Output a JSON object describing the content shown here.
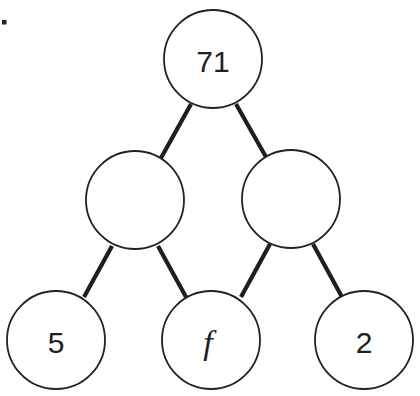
{
  "diagram": {
    "type": "number-bond-tree",
    "marker": ".",
    "nodes": [
      {
        "id": "top",
        "label": "71",
        "cx": 213,
        "cy": 59,
        "r": 49
      },
      {
        "id": "mid-left",
        "label": "",
        "cx": 135,
        "cy": 200,
        "r": 49
      },
      {
        "id": "mid-right",
        "label": "",
        "cx": 291,
        "cy": 199,
        "r": 49
      },
      {
        "id": "bottom-left",
        "label": "5",
        "cx": 56,
        "cy": 340,
        "r": 49
      },
      {
        "id": "bottom-middle",
        "label": "f",
        "cx": 211,
        "cy": 340,
        "r": 49,
        "italic": true
      },
      {
        "id": "bottom-right",
        "label": "2",
        "cx": 364,
        "cy": 340,
        "r": 49
      }
    ],
    "edges": [
      {
        "from": "top",
        "to": "mid-left"
      },
      {
        "from": "top",
        "to": "mid-right"
      },
      {
        "from": "mid-left",
        "to": "bottom-left"
      },
      {
        "from": "mid-left",
        "to": "bottom-middle"
      },
      {
        "from": "mid-right",
        "to": "bottom-middle"
      },
      {
        "from": "mid-right",
        "to": "bottom-right"
      }
    ],
    "colors": {
      "stroke": "#222222",
      "fill": "#ffffff"
    }
  }
}
